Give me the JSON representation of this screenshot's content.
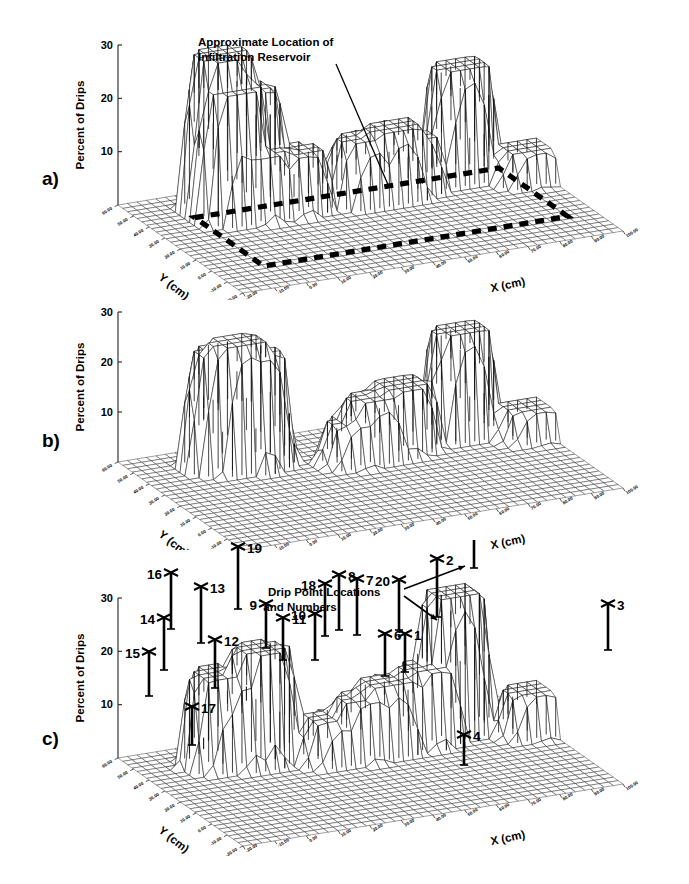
{
  "figure": {
    "title": "",
    "panels": [
      "a)",
      "b)",
      "c)"
    ]
  },
  "axes": {
    "z_label": "Percent of Drips",
    "x_label": "X (cm)",
    "y_label": "Y (cm)",
    "z_ticks": [
      "10",
      "20",
      "30"
    ],
    "z_range": [
      0,
      30
    ],
    "x_ticks": [
      "-20.00",
      "-10.00",
      "0.00",
      "10.00",
      "20.00",
      "30.00",
      "40.00",
      "50.00",
      "60.00",
      "70.00",
      "80.00",
      "90.00",
      "100.00"
    ],
    "y_ticks": [
      "60.00",
      "50.00",
      "40.00",
      "30.00",
      "20.00",
      "10.00",
      "0.00",
      "-10.00",
      "-20.00"
    ],
    "x_range": [
      -20,
      100
    ],
    "y_range": [
      -20,
      60
    ]
  },
  "panel_a": {
    "label": "a)",
    "annotation": {
      "line1": "Approximate Location of",
      "line2": "Infiltration Reservoir",
      "target": "dashed-rectangle"
    },
    "overlay": "dashed reservoir outline rectangle on base plane"
  },
  "panel_b": {
    "label": "b)",
    "annotation": null
  },
  "panel_c": {
    "label": "c)",
    "annotation": {
      "line1": "Drip Point Locations",
      "line2": "and Numbers"
    },
    "drip_points": [
      {
        "n": "1",
        "x": 405,
        "y": 672,
        "h": 38
      },
      {
        "n": "2",
        "x": 437,
        "y": 617,
        "h": 58
      },
      {
        "n": "3",
        "x": 608,
        "y": 650,
        "h": 46
      },
      {
        "n": "4",
        "x": 464,
        "y": 765,
        "h": 30
      },
      {
        "n": "5",
        "x": 474,
        "y": 568,
        "h": 68
      },
      {
        "n": "6",
        "x": 385,
        "y": 676,
        "h": 42
      },
      {
        "n": "7",
        "x": 357,
        "y": 635,
        "h": 56
      },
      {
        "n": "8",
        "x": 339,
        "y": 630,
        "h": 55
      },
      {
        "n": "9",
        "x": 266,
        "y": 648,
        "h": 44
      },
      {
        "n": "10",
        "x": 315,
        "y": 660,
        "h": 46
      },
      {
        "n": "11",
        "x": 283,
        "y": 660,
        "h": 42
      },
      {
        "n": "12",
        "x": 215,
        "y": 688,
        "h": 48
      },
      {
        "n": "13",
        "x": 201,
        "y": 643,
        "h": 56
      },
      {
        "n": "14",
        "x": 164,
        "y": 670,
        "h": 52
      },
      {
        "n": "15",
        "x": 149,
        "y": 696,
        "h": 44
      },
      {
        "n": "16",
        "x": 171,
        "y": 629,
        "h": 56
      },
      {
        "n": "17",
        "x": 192,
        "y": 745,
        "h": 38
      },
      {
        "n": "18",
        "x": 325,
        "y": 636,
        "h": 52
      },
      {
        "n": "19",
        "x": 238,
        "y": 609,
        "h": 62
      },
      {
        "n": "20",
        "x": 399,
        "y": 630,
        "h": 50
      }
    ]
  },
  "chart_data": {
    "type": "surface",
    "title": "",
    "xlabel": "X (cm)",
    "ylabel": "Y (cm)",
    "zlabel": "Percent of Drips",
    "zlim": [
      0,
      30
    ],
    "xlim": [
      -20,
      100
    ],
    "ylim": [
      -20,
      60
    ],
    "z_ticks": [
      10,
      20,
      30
    ],
    "grid": true,
    "legend": "none",
    "panels": [
      {
        "name": "a)",
        "description": "Wireframe surface of percent of drips over X-Y floor grid with dashed rectangle marking approximate location of infiltration reservoir.",
        "peaks": [
          {
            "x": 5,
            "y": 45,
            "z": 29
          },
          {
            "x": 5,
            "y": 38,
            "z": 24
          },
          {
            "x": 13,
            "y": 44,
            "z": 22
          },
          {
            "x": 13,
            "y": 36,
            "z": 12
          },
          {
            "x": 24,
            "y": 36,
            "z": 11
          },
          {
            "x": 45,
            "y": 34,
            "z": 12
          },
          {
            "x": 54,
            "y": 34,
            "z": 13
          },
          {
            "x": 60,
            "y": 36,
            "z": 10
          },
          {
            "x": 78,
            "y": 40,
            "z": 21
          },
          {
            "x": 95,
            "y": 30,
            "z": 6
          }
        ]
      },
      {
        "name": "b)",
        "description": "Wireframe surface of percent of drips, same view, no reservoir outline.",
        "peaks": [
          {
            "x": 5,
            "y": 45,
            "z": 23
          },
          {
            "x": 9,
            "y": 43,
            "z": 25
          },
          {
            "x": 14,
            "y": 42,
            "z": 22
          },
          {
            "x": 42,
            "y": 33,
            "z": 8
          },
          {
            "x": 48,
            "y": 34,
            "z": 12
          },
          {
            "x": 58,
            "y": 36,
            "z": 13
          },
          {
            "x": 78,
            "y": 40,
            "z": 21
          },
          {
            "x": 96,
            "y": 30,
            "z": 6
          }
        ]
      },
      {
        "name": "c)",
        "description": "Wireframe surface of percent of drips with 20 numbered drip point location markers.",
        "peaks": [
          {
            "x": 4,
            "y": 44,
            "z": 17
          },
          {
            "x": 10,
            "y": 42,
            "z": 15
          },
          {
            "x": 16,
            "y": 42,
            "z": 21
          },
          {
            "x": 35,
            "y": 34,
            "z": 8
          },
          {
            "x": 44,
            "y": 33,
            "z": 11
          },
          {
            "x": 52,
            "y": 34,
            "z": 13
          },
          {
            "x": 66,
            "y": 36,
            "z": 14
          },
          {
            "x": 76,
            "y": 40,
            "z": 26
          },
          {
            "x": 96,
            "y": 30,
            "z": 8
          }
        ]
      }
    ]
  }
}
